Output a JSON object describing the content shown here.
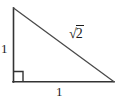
{
  "figure": {
    "kind": "right-triangle-diagram",
    "background_color": "#ffffff",
    "stroke_color": "#333333",
    "text_color": "#1b1b1b",
    "width": 119,
    "height": 103
  },
  "triangle": {
    "vertices": {
      "apex": {
        "x": 13,
        "y": 8
      },
      "right_angle": {
        "x": 13,
        "y": 82
      },
      "bottom_right": {
        "x": 114,
        "y": 82
      }
    },
    "right_angle_marker": {
      "present": true,
      "size": 10,
      "at_vertex": "right_angle"
    }
  },
  "labels": {
    "vertical_leg": "1",
    "horizontal_leg": "1",
    "hypotenuse_radical_sign": "√",
    "hypotenuse_radicand": "2",
    "hypotenuse_full": "√2"
  }
}
